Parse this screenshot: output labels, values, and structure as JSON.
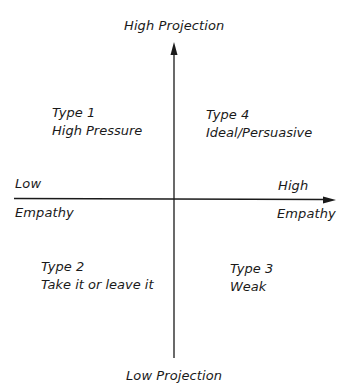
{
  "diagram": {
    "type": "quadrant",
    "y_axis": {
      "top_label": "High Projection",
      "bottom_label": "Low Projection"
    },
    "x_axis": {
      "left_label_top": "Low",
      "left_label_bottom": "Empathy",
      "right_label_top": "High",
      "right_label_bottom": "Empathy"
    },
    "quadrants": [
      {
        "position": "top-left",
        "type": "Type 1",
        "name": "High Pressure"
      },
      {
        "position": "top-right",
        "type": "Type 4",
        "name": "Ideal/Persuasive"
      },
      {
        "position": "bottom-left",
        "type": "Type 2",
        "name": "Take it or leave it"
      },
      {
        "position": "bottom-right",
        "type": "Type 3",
        "name": "Weak"
      }
    ],
    "colors": {
      "ink": "#1a1a1a",
      "background": "#ffffff"
    }
  }
}
